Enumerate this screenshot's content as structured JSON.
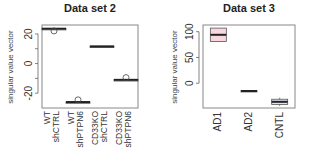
{
  "chart_data": [
    {
      "type": "box",
      "title": "Data set 2",
      "xlabel": "",
      "ylabel": "singular value vector",
      "ylim": [
        -30,
        26
      ],
      "yticks": [
        -20,
        0,
        20
      ],
      "yticks_minor": [
        -20,
        -10,
        0,
        10,
        20
      ],
      "ytick_labels": [
        "-20",
        "0",
        "20"
      ],
      "grid": false,
      "categories": [
        [
          "WT",
          "shCTRL"
        ],
        [
          "WT",
          "shPTPN6"
        ],
        [
          "CD33KO",
          "shCTRL"
        ],
        [
          "CD33KO",
          "shPTPN6"
        ]
      ],
      "boxes": [
        {
          "q1": 23.3,
          "median": 23.5,
          "q3": 23.7,
          "whisker_low": 23.3,
          "whisker_high": 23.7,
          "outliers": [
            22.0
          ],
          "fill": "#ffffff"
        },
        {
          "q1": -26.2,
          "median": -26.0,
          "q3": -25.8,
          "whisker_low": -26.2,
          "whisker_high": -25.8,
          "outliers": [
            -24.5
          ],
          "fill": "#ffffff"
        },
        {
          "q1": 11.2,
          "median": 11.5,
          "q3": 11.8,
          "whisker_low": 11.2,
          "whisker_high": 11.8,
          "outliers": [],
          "fill": "#ffffff"
        },
        {
          "q1": -11.2,
          "median": -11.0,
          "q3": -10.8,
          "whisker_low": -11.2,
          "whisker_high": -10.8,
          "outliers": [
            -9.5
          ],
          "fill": "#ffffff"
        }
      ]
    },
    {
      "type": "box",
      "title": "Data set 3",
      "xlabel": "",
      "ylabel": "singular value vector",
      "ylim": [
        -48,
        113
      ],
      "yticks": [
        0,
        50,
        100
      ],
      "ytick_labels": [
        "0",
        "50",
        "100"
      ],
      "grid": false,
      "categories": [
        [
          "AD1"
        ],
        [
          "AD2"
        ],
        [
          "CNTL"
        ]
      ],
      "boxes": [
        {
          "q1": 81,
          "median": 94,
          "q3": 107,
          "whisker_low": 81,
          "whisker_high": 107,
          "outliers": [],
          "fill": "#f8d7e0"
        },
        {
          "q1": -16,
          "median": -15,
          "q3": -14,
          "whisker_low": -16,
          "whisker_high": -14,
          "outliers": [],
          "fill": "#ffffff"
        },
        {
          "q1": -41,
          "median": -36,
          "q3": -31,
          "whisker_low": -44,
          "whisker_high": -28,
          "outliers": [],
          "fill": "#dfe6f3"
        }
      ]
    }
  ]
}
